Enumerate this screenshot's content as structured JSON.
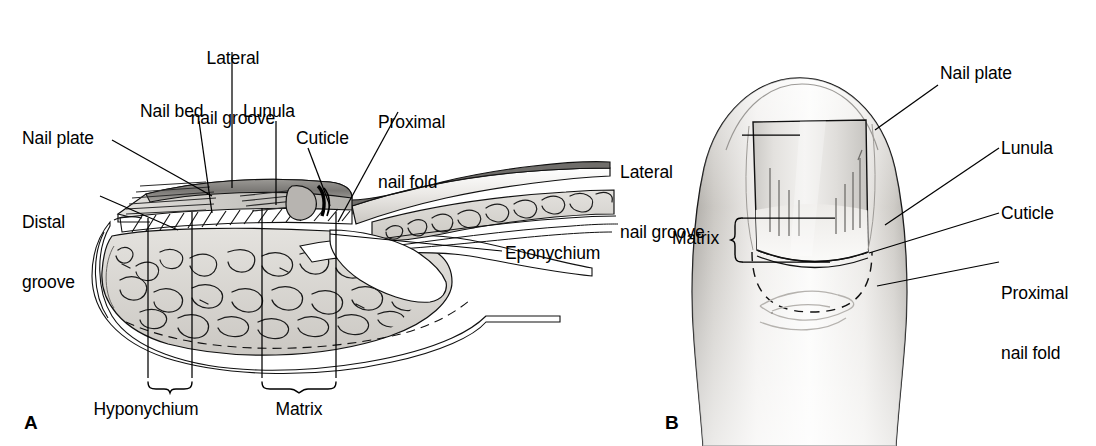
{
  "figure": {
    "background_color": "#ffffff",
    "ink_color": "#000000"
  },
  "panels": [
    {
      "id": "A",
      "letter": "A",
      "view": "sagittal cross-section of distal fingertip and nail unit",
      "labels": [
        {
          "name": "lateral-nail-groove",
          "text": "Lateral\nnail groove",
          "line1": "Lateral",
          "line2": "nail groove",
          "align": "center",
          "x": 178,
          "y": 8
        },
        {
          "name": "nail-bed",
          "text": "Nail bed",
          "line1": "Nail bed",
          "line2": "",
          "align": "left",
          "x": 140,
          "y": 101
        },
        {
          "name": "lunula",
          "text": "Lunula",
          "line1": "Lunula",
          "line2": "",
          "align": "left",
          "x": 243,
          "y": 101
        },
        {
          "name": "proximal-nail-fold",
          "text": "Proximal\nnail fold",
          "line1": "Proximal",
          "line2": "nail fold",
          "align": "left",
          "x": 378,
          "y": 72
        },
        {
          "name": "cuticle",
          "text": "Cuticle",
          "line1": "Cuticle",
          "line2": "",
          "align": "left",
          "x": 296,
          "y": 128
        },
        {
          "name": "nail-plate",
          "text": "Nail plate",
          "line1": "Nail plate",
          "line2": "",
          "align": "left",
          "x": 22,
          "y": 128
        },
        {
          "name": "distal-groove",
          "text": "Distal\ngroove",
          "line1": "Distal",
          "line2": "groove",
          "align": "left",
          "x": 22,
          "y": 172
        },
        {
          "name": "eponychium",
          "text": "Eponychium",
          "line1": "Eponychium",
          "line2": "",
          "align": "left",
          "x": 505,
          "y": 243
        },
        {
          "name": "hyponychium",
          "text": "Hyponychium",
          "line1": "Hyponychium",
          "line2": "",
          "align": "center",
          "x": 113,
          "y": 399
        },
        {
          "name": "matrix",
          "text": "Matrix",
          "line1": "Matrix",
          "line2": "",
          "align": "center",
          "x": 270,
          "y": 399
        }
      ],
      "brackets": [
        {
          "name": "hyponychium-bracket",
          "from_x": 148,
          "to_x": 192,
          "y": 384
        },
        {
          "name": "matrix-bracket",
          "from_x": 262,
          "to_x": 336,
          "y": 384
        }
      ]
    },
    {
      "id": "B",
      "letter": "B",
      "view": "dorsal (top) view of fingertip and nail",
      "labels": [
        {
          "name": "nail-plate",
          "text": "Nail plate",
          "line1": "Nail plate",
          "line2": "",
          "align": "left",
          "x": 940,
          "y": 63
        },
        {
          "name": "lateral-nail-groove",
          "text": "Lateral\nnail groove",
          "line1": "Lateral",
          "line2": "nail groove",
          "align": "left",
          "x": 620,
          "y": 122
        },
        {
          "name": "lunula",
          "text": "Lunula",
          "line1": "Lunula",
          "line2": "",
          "align": "left",
          "x": 1001,
          "y": 138
        },
        {
          "name": "cuticle",
          "text": "Cuticle",
          "line1": "Cuticle",
          "line2": "",
          "align": "left",
          "x": 1001,
          "y": 203
        },
        {
          "name": "proximal-nail-fold",
          "text": "Proximal\nnail fold",
          "line1": "Proximal",
          "line2": "nail fold",
          "align": "left",
          "x": 1001,
          "y": 243
        },
        {
          "name": "matrix",
          "text": "Matrix",
          "line1": "Matrix",
          "line2": "",
          "align": "left",
          "x": 672,
          "y": 228
        }
      ],
      "brackets": [
        {
          "name": "matrix-bracket",
          "from_y": 218,
          "to_y": 262,
          "x": 742
        }
      ]
    }
  ],
  "colors": {
    "ink": "#000000",
    "outline": "#1a1a1a",
    "skin_light": "#f2f1ef",
    "skin_mid": "#dedcd8",
    "skin_dark": "#b9b6b1",
    "tissue_fill": "#d8d6d1",
    "nail_plate_fill": "#cfcdc8",
    "nail_top_dark": "#7d7b78",
    "hatch": "#2b2b2b"
  }
}
